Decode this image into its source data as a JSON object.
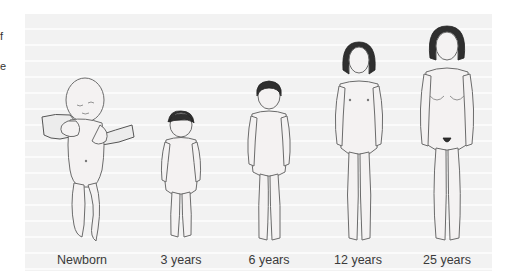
{
  "figure": {
    "edge_text_fragments": [
      "f",
      "e"
    ],
    "stages": [
      {
        "label": "Newborn",
        "icon": "newborn-figure-icon"
      },
      {
        "label": "3 years",
        "icon": "child-3-years-figure-icon"
      },
      {
        "label": "6 years",
        "icon": "child-6-years-figure-icon"
      },
      {
        "label": "12 years",
        "icon": "adolescent-12-years-figure-icon"
      },
      {
        "label": "25 years",
        "icon": "adult-25-years-figure-icon"
      }
    ],
    "colors": {
      "panel_background": "#f2f2f2",
      "label_text": "#3a3a3a",
      "outline": "#6b6b6b",
      "hair": "#2f2f2f"
    }
  }
}
